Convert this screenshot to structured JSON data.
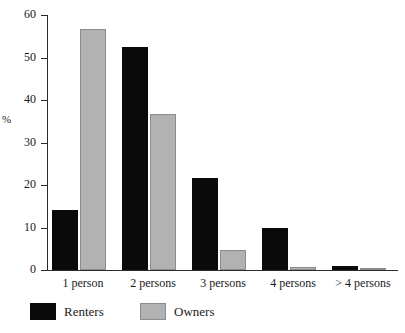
{
  "chart_data": {
    "type": "bar",
    "title": "",
    "subtitle": "",
    "xlabel": "",
    "ylabel": "%",
    "ylim": [
      0,
      60
    ],
    "yticks": [
      0,
      10,
      20,
      30,
      40,
      50,
      60
    ],
    "grid": false,
    "legend_position": "bottom",
    "categories": [
      "1 person",
      "2 persons",
      "3 persons",
      "4 persons",
      "> 4 persons"
    ],
    "series": [
      {
        "name": "Renters",
        "color": "#0a0a0a",
        "values": [
          14.2,
          52.5,
          21.6,
          10.0,
          0.9
        ]
      },
      {
        "name": "Owners",
        "color": "#b2b2b2",
        "values": [
          56.8,
          36.8,
          4.6,
          0.7,
          0.3
        ]
      }
    ]
  },
  "axis": {
    "y_label": "%",
    "tick_labels": [
      "0",
      "10",
      "20",
      "30",
      "40",
      "50",
      "60"
    ]
  },
  "legend": {
    "items": [
      {
        "label": "Renters"
      },
      {
        "label": "Owners"
      }
    ]
  }
}
